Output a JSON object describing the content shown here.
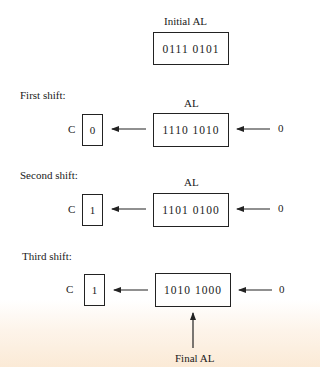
{
  "initial": {
    "label": "Initial AL",
    "value": "0111  0101"
  },
  "shifts": [
    {
      "title": "First shift:",
      "register_label": "AL",
      "carry_label": "C",
      "carry_value": "0",
      "value": "1110  1010",
      "input_bit": "0"
    },
    {
      "title": "Second shift:",
      "register_label": "AL",
      "carry_label": "C",
      "carry_value": "1",
      "value": "1101  0100",
      "input_bit": "0"
    },
    {
      "title": "Third shift:",
      "register_label": "",
      "carry_label": "C",
      "carry_value": "1",
      "value": "1010  1000",
      "input_bit": "0"
    }
  ],
  "final_label": "Final AL"
}
